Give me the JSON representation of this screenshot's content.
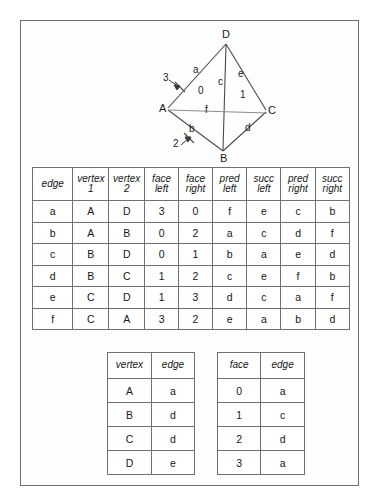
{
  "diagram": {
    "vertices": [
      {
        "label": "D",
        "x": 205,
        "y": 28
      },
      {
        "label": "A",
        "x": 145,
        "y": 95
      },
      {
        "label": "C",
        "x": 247,
        "y": 98
      },
      {
        "label": "B",
        "x": 202,
        "y": 141
      }
    ],
    "edge_labels": [
      {
        "label": "a",
        "x": 176,
        "y": 58
      },
      {
        "label": "c",
        "x": 200,
        "y": 70
      },
      {
        "label": "e",
        "x": 218,
        "y": 62
      },
      {
        "label": "f",
        "x": 187,
        "y": 101
      },
      {
        "label": "b",
        "x": 172,
        "y": 118
      },
      {
        "label": "d",
        "x": 227,
        "y": 117
      }
    ],
    "face_labels": [
      {
        "label": "0",
        "x": 180,
        "y": 79
      },
      {
        "label": "1",
        "x": 222,
        "y": 83
      },
      {
        "label": "2",
        "x": 158,
        "y": 132
      },
      {
        "label": "3",
        "x": 148,
        "y": 68
      }
    ]
  },
  "main_table": {
    "headers": [
      "edge",
      "vertex 1",
      "vertex 2",
      "face left",
      "face right",
      "pred left",
      "succ left",
      "pred right",
      "succ right"
    ],
    "header_lines": [
      [
        "edge"
      ],
      [
        "vertex",
        "1"
      ],
      [
        "vertex",
        "2"
      ],
      [
        "face",
        "left"
      ],
      [
        "face",
        "right"
      ],
      [
        "pred",
        "left"
      ],
      [
        "succ",
        "left"
      ],
      [
        "pred",
        "right"
      ],
      [
        "succ",
        "right"
      ]
    ],
    "rows": [
      [
        "a",
        "A",
        "D",
        "3",
        "0",
        "f",
        "e",
        "c",
        "b"
      ],
      [
        "b",
        "A",
        "B",
        "0",
        "2",
        "a",
        "c",
        "d",
        "f"
      ],
      [
        "c",
        "B",
        "D",
        "0",
        "1",
        "b",
        "a",
        "e",
        "d"
      ],
      [
        "d",
        "B",
        "C",
        "1",
        "2",
        "c",
        "e",
        "f",
        "b"
      ],
      [
        "e",
        "C",
        "D",
        "1",
        "3",
        "d",
        "c",
        "a",
        "f"
      ],
      [
        "f",
        "C",
        "A",
        "3",
        "2",
        "e",
        "a",
        "b",
        "d"
      ]
    ]
  },
  "vertex_table": {
    "headers": [
      "vertex",
      "edge"
    ],
    "rows": [
      [
        "A",
        "a"
      ],
      [
        "B",
        "d"
      ],
      [
        "C",
        "d"
      ],
      [
        "D",
        "e"
      ]
    ]
  },
  "face_table": {
    "headers": [
      "face",
      "edge"
    ],
    "rows": [
      [
        "0",
        "a"
      ],
      [
        "1",
        "c"
      ],
      [
        "2",
        "d"
      ],
      [
        "3",
        "a"
      ]
    ]
  },
  "colors": {
    "border": "#6f7275",
    "text": "#161616",
    "stroke": "#4a4a4a",
    "background": "#fefefe"
  }
}
